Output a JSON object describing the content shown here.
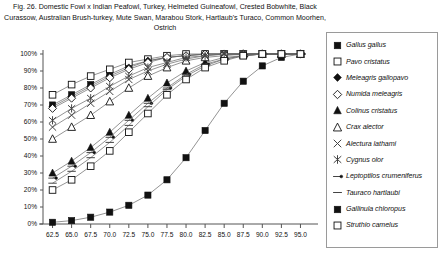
{
  "caption": "Fig. 26.  Domestic Fowl x Indian Peafowl, Turkey, Helmeted Guineafowl, Crested Bobwhite, Black Curassow, Australian Brush-turkey, Mute Swan, Marabou Stork, Hartlaub's Turaco, Common Moorhen, Ostrich",
  "legend": {
    "items": [
      {
        "label": "Gallus gallus",
        "marker": "filled-square"
      },
      {
        "label": "Pavo cristatus",
        "marker": "open-square"
      },
      {
        "label": "Meleagris gallopavo",
        "marker": "filled-diamond"
      },
      {
        "label": "Numida meleagris",
        "marker": "open-diamond"
      },
      {
        "label": "Colinus cristatus",
        "marker": "filled-triangle"
      },
      {
        "label": "Crax alector",
        "marker": "open-triangle"
      },
      {
        "label": "Alectura lathami",
        "marker": "cross-x"
      },
      {
        "label": "Cygnus olor",
        "marker": "asterisk"
      },
      {
        "label": "Leptoptilos crumeniferus",
        "marker": "dash-dot"
      },
      {
        "label": "Tauraco hartlaubi",
        "marker": "dash"
      },
      {
        "label": "Gallinula chloropus",
        "marker": "filled-square"
      },
      {
        "label": "Struthio camelus",
        "marker": "open-square"
      }
    ]
  },
  "chart_data": {
    "type": "line",
    "title": "",
    "xlabel": "",
    "ylabel": "",
    "xlim": [
      61.25,
      96.25
    ],
    "ylim": [
      0,
      100
    ],
    "grid": false,
    "legend_position": "right",
    "x": [
      62.5,
      65.0,
      67.5,
      70.0,
      72.5,
      75.0,
      77.5,
      80.0,
      82.5,
      85.0,
      87.5,
      90.0,
      92.5,
      95.0
    ],
    "xticklabels": [
      "62.5",
      "65.0",
      "67.5",
      "70.0",
      "72.5",
      "75.0",
      "77.5",
      "80.0",
      "82.5",
      "85.0",
      "87.5",
      "90.0",
      "92.5",
      "95.0"
    ],
    "yticklabels": [
      "0%",
      "10%",
      "20%",
      "30%",
      "40%",
      "50%",
      "60%",
      "70%",
      "80%",
      "90%",
      "100%"
    ],
    "series": [
      {
        "name": "Gallus gallus",
        "marker": "filled-square",
        "values": [
          70,
          76,
          82,
          88,
          93,
          96,
          98,
          99,
          100,
          100,
          100,
          100,
          100,
          100
        ]
      },
      {
        "name": "Pavo cristatus",
        "marker": "open-square",
        "values": [
          76,
          82,
          87,
          91,
          95,
          97,
          99,
          100,
          100,
          100,
          100,
          100,
          100,
          100
        ]
      },
      {
        "name": "Meleagris gallopavo",
        "marker": "filled-diamond",
        "values": [
          69,
          75,
          81,
          87,
          92,
          96,
          98,
          99,
          100,
          100,
          100,
          100,
          100,
          100
        ]
      },
      {
        "name": "Numida meleagris",
        "marker": "open-diamond",
        "values": [
          68,
          74,
          80,
          86,
          91,
          95,
          98,
          99,
          100,
          100,
          100,
          100,
          100,
          100
        ]
      },
      {
        "name": "Colinus cristatus",
        "marker": "filled-triangle",
        "values": [
          30,
          37,
          45,
          54,
          64,
          74,
          83,
          90,
          95,
          98,
          99,
          100,
          100,
          100
        ]
      },
      {
        "name": "Crax alector",
        "marker": "open-triangle",
        "values": [
          50,
          57,
          64,
          72,
          80,
          87,
          92,
          96,
          98,
          99,
          100,
          100,
          100,
          100
        ]
      },
      {
        "name": "Alectura lathami",
        "marker": "cross-x",
        "values": [
          57,
          64,
          71,
          78,
          85,
          90,
          94,
          97,
          99,
          100,
          100,
          100,
          100,
          100
        ]
      },
      {
        "name": "Cygnus olor",
        "marker": "asterisk",
        "values": [
          61,
          68,
          74,
          81,
          87,
          92,
          95,
          98,
          99,
          100,
          100,
          100,
          100,
          100
        ]
      },
      {
        "name": "Leptoptilos crumeniferus",
        "marker": "dash-dot",
        "values": [
          27,
          34,
          42,
          51,
          61,
          71,
          80,
          88,
          94,
          97,
          99,
          100,
          100,
          100
        ]
      },
      {
        "name": "Tauraco hartlaubi",
        "marker": "dash",
        "values": [
          24,
          31,
          39,
          48,
          58,
          69,
          79,
          87,
          93,
          97,
          99,
          100,
          100,
          100
        ]
      },
      {
        "name": "Gallinula chloropus",
        "marker": "filled-square",
        "values": [
          1,
          2,
          4,
          7,
          11,
          17,
          26,
          39,
          55,
          71,
          84,
          93,
          98,
          100
        ]
      },
      {
        "name": "Struthio camelus",
        "marker": "open-square",
        "values": [
          20,
          26,
          34,
          43,
          54,
          65,
          76,
          85,
          92,
          96,
          99,
          100,
          100,
          100
        ]
      }
    ]
  }
}
